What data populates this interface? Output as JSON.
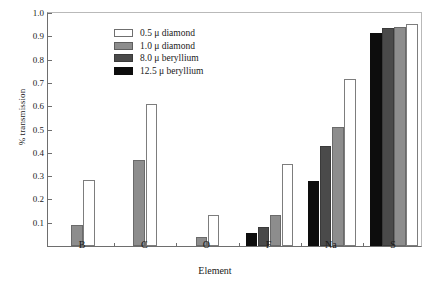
{
  "chart_data": {
    "type": "bar",
    "title": "",
    "xlabel": "Element",
    "ylabel": "% transmission",
    "categories": [
      "B",
      "C",
      "O",
      "F",
      "Na",
      "S"
    ],
    "ylim": [
      0,
      1.0
    ],
    "yticks": [
      "0.1",
      "0.2",
      "0.3",
      "0.4",
      "0.5",
      "0.6",
      "0.7",
      "0.8",
      "0.9",
      "1.0"
    ],
    "ytick_values": [
      0.1,
      0.2,
      0.3,
      0.4,
      0.5,
      0.6,
      0.7,
      0.8,
      0.9,
      1.0
    ],
    "grid": false,
    "legend_position": "upper-left-inside",
    "series": [
      {
        "name": "0.5 μ diamond",
        "color": "#ffffff",
        "values": [
          0.285,
          0.61,
          0.135,
          0.35,
          0.715,
          0.955
        ]
      },
      {
        "name": "1.0 μ diamond",
        "color": "#8d8d8d",
        "values": [
          0.09,
          0.37,
          0.04,
          0.135,
          0.51,
          0.94
        ]
      },
      {
        "name": "8.0 μ beryllium",
        "color": "#4a4a4a",
        "values": [
          0,
          0,
          0,
          0.08,
          0.43,
          0.935
        ]
      },
      {
        "name": "12.5 μ beryllium",
        "color": "#0d0d0d",
        "values": [
          0,
          0,
          0,
          0.055,
          0.28,
          0.915
        ]
      }
    ]
  },
  "axes": {
    "ylabel": "% transmission",
    "xlabel": "Element"
  }
}
